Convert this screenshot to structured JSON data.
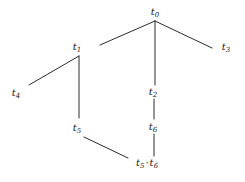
{
  "figure": {
    "kind": "tree-diagram",
    "width": 245,
    "height": 182,
    "background_color": "#ffffff",
    "line_color": "#2b2b2b",
    "text_color": "#1a1a1a",
    "line_width": 1
  },
  "nodes": [
    {
      "id": "t0",
      "base": "t",
      "sub": "0",
      "label": "t0",
      "x": 155,
      "y": 12
    },
    {
      "id": "t1",
      "base": "t",
      "sub": "1",
      "label": "t1",
      "x": 77,
      "y": 47
    },
    {
      "id": "t3",
      "base": "t",
      "sub": "3",
      "label": "t3",
      "x": 226,
      "y": 47
    },
    {
      "id": "t4",
      "base": "t",
      "sub": "4",
      "label": "t4",
      "x": 16,
      "y": 93
    },
    {
      "id": "t2",
      "base": "t",
      "sub": "2",
      "label": "t2",
      "x": 153,
      "y": 92
    },
    {
      "id": "t5",
      "base": "t",
      "sub": "5",
      "label": "t5",
      "x": 77,
      "y": 128
    },
    {
      "id": "t6",
      "base": "t",
      "sub": "6",
      "label": "t6",
      "x": 153,
      "y": 127
    },
    {
      "id": "t5t6",
      "base": "t",
      "sub": "5",
      "base2": "t",
      "sub2": "6",
      "operator": "·",
      "label": "t5 · t6",
      "x": 147,
      "y": 163
    }
  ],
  "edges": [
    {
      "id": "e-t0-t1",
      "from": "t0",
      "to": "t1",
      "x1": 155,
      "y1": 21,
      "x2": 100,
      "y2": 45
    },
    {
      "id": "e-t0-t2",
      "from": "t0",
      "to": "t2",
      "x1": 155,
      "y1": 21,
      "x2": 155,
      "y2": 85
    },
    {
      "id": "e-t0-t3",
      "from": "t0",
      "to": "t3",
      "x1": 155,
      "y1": 21,
      "x2": 212,
      "y2": 48
    },
    {
      "id": "e-t1-t4",
      "from": "t1",
      "to": "t4",
      "x1": 79,
      "y1": 56,
      "x2": 29,
      "y2": 85
    },
    {
      "id": "e-t1-t5",
      "from": "t1",
      "to": "t5",
      "x1": 79,
      "y1": 56,
      "x2": 79,
      "y2": 118
    },
    {
      "id": "e-t2-t6",
      "from": "t2",
      "to": "t6",
      "x1": 154,
      "y1": 99,
      "x2": 154,
      "y2": 119
    },
    {
      "id": "e-t6-t5t6",
      "from": "t6",
      "to": "t5t6",
      "x1": 154,
      "y1": 134,
      "x2": 154,
      "y2": 156
    },
    {
      "id": "e-t5-t5t6",
      "from": "t5",
      "to": "t5t6",
      "x1": 84,
      "y1": 137,
      "x2": 128,
      "y2": 158
    }
  ]
}
